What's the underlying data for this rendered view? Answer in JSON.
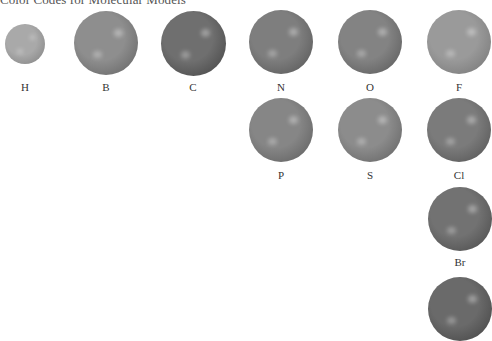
{
  "title": "Color Codes for Molecular Models",
  "elements": [
    {
      "symbol": "H",
      "x": 5,
      "y": 24,
      "d": 40,
      "shade": "#a9a9a9",
      "dark": "#7e7e7e"
    },
    {
      "symbol": "B",
      "x": 74,
      "y": 11,
      "d": 64,
      "shade": "#8e8e8e",
      "dark": "#5f5f5f"
    },
    {
      "symbol": "C",
      "x": 161,
      "y": 11,
      "d": 65,
      "shade": "#6f6f6f",
      "dark": "#404040"
    },
    {
      "symbol": "N",
      "x": 249,
      "y": 10,
      "d": 64,
      "shade": "#7e7e7e",
      "dark": "#525252"
    },
    {
      "symbol": "O",
      "x": 338,
      "y": 10,
      "d": 64,
      "shade": "#838383",
      "dark": "#555555"
    },
    {
      "symbol": "F",
      "x": 427,
      "y": 10,
      "d": 64,
      "shade": "#9a9a9a",
      "dark": "#727272"
    },
    {
      "symbol": "P",
      "x": 249,
      "y": 98,
      "d": 64,
      "shade": "#868686",
      "dark": "#5a5a5a"
    },
    {
      "symbol": "S",
      "x": 338,
      "y": 98,
      "d": 64,
      "shade": "#8c8c8c",
      "dark": "#5e5e5e"
    },
    {
      "symbol": "Cl",
      "x": 427,
      "y": 98,
      "d": 64,
      "shade": "#7b7b7b",
      "dark": "#4f4f4f"
    },
    {
      "symbol": "Br",
      "x": 428,
      "y": 187,
      "d": 64,
      "shade": "#727272",
      "dark": "#464646"
    },
    {
      "symbol": "",
      "x": 428,
      "y": 277,
      "d": 64,
      "shade": "#6a6a6a",
      "dark": "#404040"
    }
  ],
  "labels": [
    {
      "text": "H",
      "x": -7,
      "y": 81
    },
    {
      "text": "B",
      "x": 74,
      "y": 81
    },
    {
      "text": "C",
      "x": 161,
      "y": 81
    },
    {
      "text": "N",
      "x": 249,
      "y": 81
    },
    {
      "text": "O",
      "x": 338,
      "y": 81
    },
    {
      "text": "F",
      "x": 427,
      "y": 81
    },
    {
      "text": "P",
      "x": 249,
      "y": 169
    },
    {
      "text": "S",
      "x": 338,
      "y": 169
    },
    {
      "text": "Cl",
      "x": 427,
      "y": 169
    },
    {
      "text": "Br",
      "x": 428,
      "y": 256
    }
  ]
}
